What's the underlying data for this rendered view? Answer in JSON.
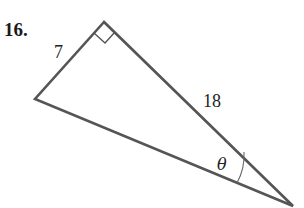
{
  "problem": {
    "number": "16."
  },
  "diagram": {
    "type": "right-triangle",
    "line_color": "#555555",
    "vertices": {
      "top": [
        104,
        22
      ],
      "left": [
        35,
        99
      ],
      "bottom_right": [
        293,
        206
      ]
    },
    "right_angle_at": "top",
    "sides": [
      {
        "label": "7",
        "between": [
          "left",
          "top"
        ]
      },
      {
        "label": "18",
        "between": [
          "top",
          "bottom_right"
        ]
      }
    ],
    "angle": {
      "label": "θ",
      "at": "bottom_right"
    }
  }
}
